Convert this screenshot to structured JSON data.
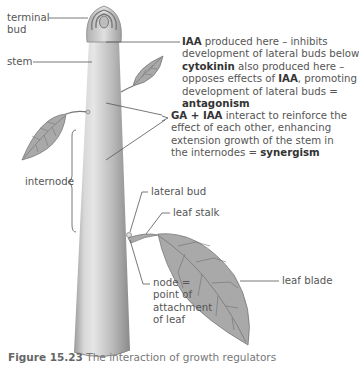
{
  "labels": {
    "terminal_bud": [
      "terminal",
      "bud"
    ],
    "stem": "stem",
    "internode": "internode",
    "lateral_bud": "lateral bud",
    "leaf_stalk": "leaf stalk",
    "leaf_blade": "leaf blade",
    "node": [
      "node =",
      "point of",
      "attachment",
      "of leaf"
    ]
  },
  "annotations": {
    "iaa_block": {
      "line1_bold": "IAA",
      "line1_rest": " produced here – inhibits",
      "line2": "development of lateral buds below",
      "line3_bold": "cytokinin",
      "line3_rest": " also produced here –",
      "line4_a": "opposes effects of ",
      "line4_bold": "IAA",
      "line4_b": ", promoting",
      "line5": "development of lateral buds =",
      "line6_bold": "antagonism"
    },
    "ga_block": {
      "line1_bold": "GA + IAA",
      "line1_rest": " interact to reinforce the",
      "line2": "effect of each other, enhancing",
      "line3": "extension growth of the stem in",
      "line4_a": "the internodes = ",
      "line4_bold": "synergism"
    }
  },
  "caption": {
    "figure_number": "Figure 15.23",
    "text": " The interaction of growth regulators"
  },
  "colors": {
    "stem_light": "#e4e4e4",
    "stem_dark": "#8f8f8f",
    "leaf_fill": "#a9a9a9",
    "leaf_vein": "#6e6e6e",
    "line": "#555555"
  }
}
